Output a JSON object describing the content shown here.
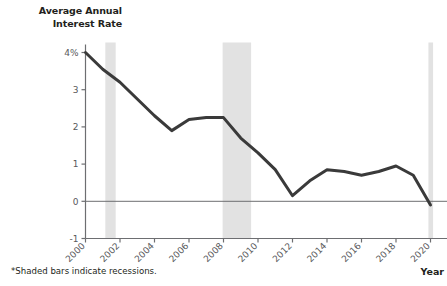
{
  "chart_data": {
    "type": "line",
    "title": "Average Annual\nInterest Rate",
    "xlabel": "Year",
    "ylabel": "",
    "footnote": "*Shaded bars indicate recessions.",
    "grid": false,
    "legend": "none",
    "xlim": [
      2000,
      2020
    ],
    "ylim": [
      -1,
      4
    ],
    "x": [
      2000,
      2001,
      2002,
      2003,
      2004,
      2005,
      2006,
      2007,
      2008,
      2009,
      2010,
      2011,
      2012,
      2013,
      2014,
      2015,
      2016,
      2017,
      2018,
      2019,
      2020
    ],
    "values": [
      4.0,
      3.55,
      3.2,
      2.75,
      2.3,
      1.9,
      2.2,
      2.25,
      2.25,
      1.7,
      1.3,
      0.85,
      0.15,
      0.55,
      0.85,
      0.8,
      0.7,
      0.8,
      0.95,
      0.7,
      -0.1
    ],
    "series": [
      {
        "name": "Average Annual Interest Rate",
        "color": "#3a3a3a",
        "values": [
          4.0,
          3.55,
          3.2,
          2.75,
          2.3,
          1.9,
          2.2,
          2.25,
          2.25,
          1.7,
          1.3,
          0.85,
          0.15,
          0.55,
          0.85,
          0.8,
          0.7,
          0.8,
          0.95,
          0.7,
          -0.1
        ]
      }
    ],
    "ytick_values": [
      4,
      3,
      2,
      1,
      0,
      -1
    ],
    "ytick_labels": [
      "4%",
      "3",
      "2",
      "1",
      "0",
      "-1"
    ],
    "xtick_values": [
      2000,
      2002,
      2004,
      2006,
      2008,
      2010,
      2012,
      2014,
      2016,
      2018,
      2020
    ],
    "xtick_labels": [
      "2000",
      "2002",
      "2004",
      "2006",
      "2008",
      "2010",
      "2012",
      "2014",
      "2016",
      "2018",
      "2020"
    ],
    "shaded_regions": [
      {
        "label": "recession-2001",
        "start": 2001.15,
        "end": 2001.75
      },
      {
        "label": "recession-2008",
        "start": 2007.95,
        "end": 2009.6
      },
      {
        "label": "recession-2020",
        "start": 2019.88,
        "end": 2020.15
      }
    ],
    "shade_color": "#e2e2e2",
    "zero_line_color": "#6d6e71",
    "axis_color": "#6d6e71"
  }
}
